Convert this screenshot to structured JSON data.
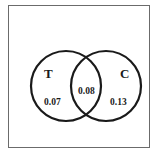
{
  "diagram": {
    "type": "venn",
    "frame_color": "#6b6b6b",
    "stroke_color": "#1a1a1a",
    "sets": [
      {
        "id": "T",
        "label": "T",
        "only_value": "0.07"
      },
      {
        "id": "C",
        "label": "C",
        "only_value": "0.13"
      }
    ],
    "intersection": {
      "sets": [
        "T",
        "C"
      ],
      "value": "0.08"
    }
  }
}
